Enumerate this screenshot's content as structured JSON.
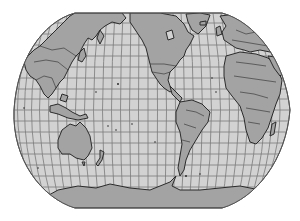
{
  "map": {
    "type": "world-map",
    "projection": "robinson",
    "center": "pacific",
    "graticule": {
      "latitude_step_deg": 10,
      "longitude_step_deg": 10
    },
    "colors": {
      "background": "#ffffff",
      "ocean": "#d2d2d2",
      "land": "#a3a3a3",
      "border": "#2b2b2b",
      "graticule": "#7a7a7a",
      "outline": "#555555"
    },
    "regions": [
      "Asia",
      "Europe",
      "Africa",
      "North America",
      "South America",
      "Australia",
      "Antarctica",
      "Greenland",
      "New Zealand",
      "Indonesia",
      "Madagascar",
      "Japan"
    ]
  }
}
